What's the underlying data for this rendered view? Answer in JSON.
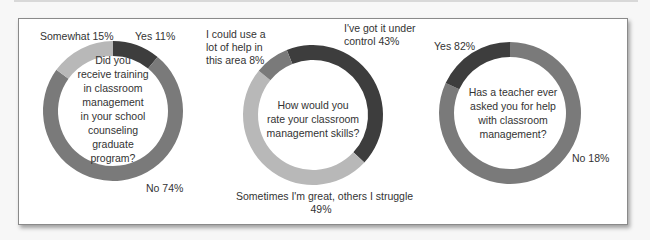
{
  "chart_data": [
    {
      "type": "pie",
      "subtype": "donut",
      "title": "Did you receive training in classroom management in your school counseling graduate program?",
      "categories": [
        "Yes",
        "No",
        "Somewhat"
      ],
      "values": [
        11,
        74,
        15
      ],
      "labels": [
        "Yes 11%",
        "No 74%",
        "Somewhat 15%"
      ],
      "colors": [
        "#3d3d3d",
        "#7a7a7a",
        "#b8b8b8"
      ]
    },
    {
      "type": "pie",
      "subtype": "donut",
      "title": "How would you rate your classroom management skills?",
      "categories": [
        "I've got it under control",
        "Sometimes I'm great, others I struggle",
        "I could use a lot of help in this area"
      ],
      "values": [
        43,
        49,
        8
      ],
      "labels": [
        "I've got it under control 43%",
        "Sometimes I'm great, others I struggle 49%",
        "I could use a lot of help in this area 8%"
      ],
      "colors": [
        "#3d3d3d",
        "#b8b8b8",
        "#7a7a7a"
      ]
    },
    {
      "type": "pie",
      "subtype": "donut",
      "title": "Has a teacher ever asked you for help with classroom management?",
      "categories": [
        "Yes",
        "No"
      ],
      "values": [
        82,
        18
      ],
      "labels": [
        "Yes 82%",
        "No 18%"
      ],
      "colors": [
        "#3d3d3d",
        "#7a7a7a"
      ]
    }
  ],
  "charts": {
    "c1": {
      "center_lines": [
        "Did you",
        "receive training",
        "in classroom",
        "management",
        "in your school",
        "counseling",
        "graduate",
        "program?"
      ],
      "label_yes": "Yes 11%",
      "label_no": "No 74%",
      "label_somewhat": "Somewhat 15%"
    },
    "c2": {
      "center_lines": [
        "How would you",
        "rate your classroom",
        "management skills?"
      ],
      "label_help": [
        "I could use a",
        "lot of help in",
        "this area 8%"
      ],
      "label_control": [
        "I've got it under",
        "control 43%"
      ],
      "label_sometimes": [
        "Sometimes I'm great, others I struggle",
        "49%"
      ]
    },
    "c3": {
      "center_lines": [
        "Has a teacher ever",
        "asked you for help",
        "with classroom",
        "management?"
      ],
      "label_yes": "Yes 82%",
      "label_no": "No 18%"
    }
  },
  "colors": {
    "dark": "#3d3d3d",
    "medium": "#7a7a7a",
    "light": "#b8b8b8"
  }
}
